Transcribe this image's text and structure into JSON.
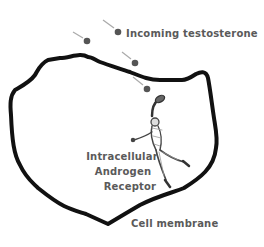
{
  "diagram": {
    "labels": {
      "incoming": "Incoming testosterone",
      "receptor_line1": "Intracellular",
      "receptor_line2": "Androgen",
      "receptor_line3": "Receptor",
      "membrane": "Cell membrane"
    },
    "colors": {
      "membrane": "#111111",
      "molecule": "#555555",
      "trail": "#aaaaaa",
      "text": "#5a5a5a"
    },
    "molecules": [
      {
        "x": 87,
        "y": 41
      },
      {
        "x": 118,
        "y": 32
      },
      {
        "x": 135,
        "y": 63
      },
      {
        "x": 147,
        "y": 89
      }
    ],
    "elements": {
      "receptor_figure": "baseball-player-catching-icon"
    }
  }
}
